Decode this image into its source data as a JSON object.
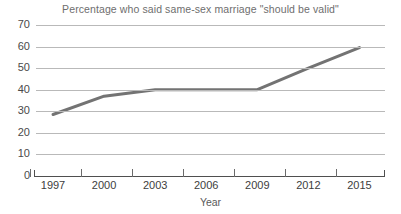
{
  "chart_data": {
    "type": "line",
    "title": "Percentage who said same-sex marriage \"should be valid\"",
    "xlabel": "Year",
    "ylabel": "",
    "x": [
      1997,
      2000,
      2003,
      2006,
      2009,
      2012,
      2015
    ],
    "values": [
      28.5,
      37,
      40,
      40,
      40,
      50,
      59.5
    ],
    "series": [
      {
        "name": "Percentage who said same-sex marriage should be valid",
        "values": [
          28.5,
          37,
          40,
          40,
          40,
          50,
          59.5
        ]
      }
    ],
    "xtick_labels": [
      "1997",
      "2000",
      "2003",
      "2006",
      "2009",
      "2012",
      "2015"
    ],
    "ytick_labels": [
      "0",
      "10",
      "20",
      "30",
      "40",
      "50",
      "60",
      "70"
    ],
    "yticks": [
      0,
      10,
      20,
      30,
      40,
      50,
      60,
      70
    ],
    "ylim": [
      0,
      70
    ],
    "xlim": [
      1996,
      2016.5
    ],
    "grid": "horizontal",
    "legend": "none",
    "line_color": "#737373",
    "gridline_color": "#b9b9b9",
    "axis_color": "#4f4f4f",
    "title_color": "#6e6e6e"
  }
}
